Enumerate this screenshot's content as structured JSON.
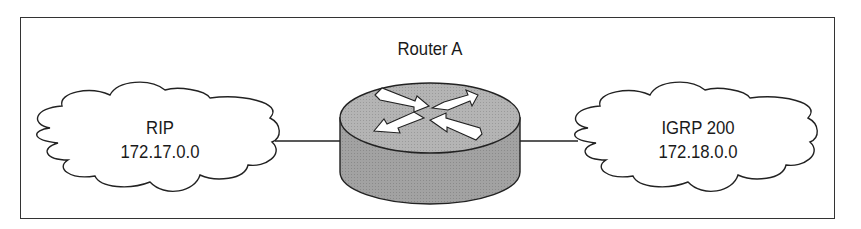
{
  "diagram": {
    "router": {
      "label": "Router A",
      "icon": "router-icon"
    },
    "networks": [
      {
        "protocol": "RIP",
        "address": "172.17.0.0",
        "side": "left"
      },
      {
        "protocol": "IGRP 200",
        "address": "172.18.0.0",
        "side": "right"
      }
    ],
    "colors": {
      "router_top": "#b8b8b8",
      "router_side": "#a0a0a0",
      "stroke": "#222222",
      "background": "#ffffff"
    }
  }
}
